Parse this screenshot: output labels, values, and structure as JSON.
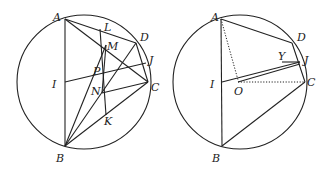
{
  "figures": [
    {
      "name": "left-figure",
      "circle": {
        "cx": 84,
        "cy": 82,
        "r": 67
      },
      "points": {
        "A": [
          65,
          19
        ],
        "L": [
          100,
          29
        ],
        "D": [
          136,
          43
        ],
        "M": [
          106,
          45
        ],
        "J": [
          146,
          63
        ],
        "P": [
          103,
          72
        ],
        "I": [
          65,
          82
        ],
        "C": [
          148,
          82
        ],
        "N": [
          102,
          93
        ],
        "K": [
          106,
          115
        ],
        "B": [
          65,
          146
        ]
      },
      "labels": [
        {
          "text": "A",
          "x": 53,
          "y": 21
        },
        {
          "text": "L",
          "x": 104,
          "y": 31
        },
        {
          "text": "D",
          "x": 140,
          "y": 41
        },
        {
          "text": "M",
          "x": 107,
          "y": 50
        },
        {
          "text": "J",
          "x": 149,
          "y": 64
        },
        {
          "text": "P",
          "x": 93,
          "y": 75
        },
        {
          "text": "I",
          "x": 52,
          "y": 88
        },
        {
          "text": "C",
          "x": 151,
          "y": 91
        },
        {
          "text": "N",
          "x": 91,
          "y": 95
        },
        {
          "text": "K",
          "x": 104,
          "y": 125
        },
        {
          "text": "B",
          "x": 56,
          "y": 162
        }
      ]
    },
    {
      "name": "right-figure",
      "circle": {
        "cx": 240,
        "cy": 82,
        "r": 67
      },
      "points": {
        "A": [
          221,
          19
        ],
        "D": [
          292,
          43
        ],
        "Y": [
          282,
          62
        ],
        "J": [
          300,
          62
        ],
        "C": [
          305,
          82
        ],
        "I": [
          222,
          82
        ],
        "O": [
          238,
          82
        ],
        "B": [
          222,
          146
        ]
      },
      "labels": [
        {
          "text": "A",
          "x": 211,
          "y": 21
        },
        {
          "text": "D",
          "x": 297,
          "y": 41
        },
        {
          "text": "Y",
          "x": 278,
          "y": 60
        },
        {
          "text": "J",
          "x": 304,
          "y": 64
        },
        {
          "text": "I",
          "x": 210,
          "y": 88
        },
        {
          "text": "O",
          "x": 234,
          "y": 95
        },
        {
          "text": "C",
          "x": 307,
          "y": 86
        },
        {
          "text": "B",
          "x": 212,
          "y": 162
        }
      ]
    }
  ]
}
